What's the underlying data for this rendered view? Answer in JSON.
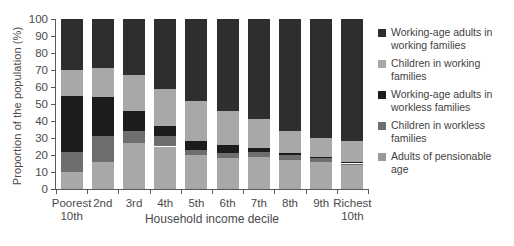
{
  "chart_data": {
    "type": "bar",
    "stacked": true,
    "title": "",
    "xlabel": "Household income decile",
    "ylabel": "Proportion of the population (%)",
    "ylim": [
      0,
      100
    ],
    "ytick_labels": [
      "0",
      "10",
      "20",
      "30",
      "40",
      "50",
      "60",
      "70",
      "80",
      "90",
      "100"
    ],
    "yticks": [
      0,
      10,
      20,
      30,
      40,
      50,
      60,
      70,
      80,
      90,
      100
    ],
    "grid": false,
    "legend_position": "right",
    "categories": [
      "Poorest\n10th",
      "2nd",
      "3rd",
      "4th",
      "5th",
      "6th",
      "7th",
      "8th",
      "9th",
      "Richest\n10th"
    ],
    "category_labels": [
      [
        "Poorest",
        "10th"
      ],
      [
        "2nd",
        ""
      ],
      [
        "3rd",
        ""
      ],
      [
        "4th",
        ""
      ],
      [
        "5th",
        ""
      ],
      [
        "6th",
        ""
      ],
      [
        "7th",
        ""
      ],
      [
        "8th",
        ""
      ],
      [
        "9th",
        ""
      ],
      [
        "Richest",
        "10th"
      ]
    ],
    "series": [
      {
        "name": "Adults of pensionable age",
        "color": "#a8a8a8",
        "values": [
          10,
          16,
          27,
          25,
          20,
          18,
          19,
          17,
          16,
          14
        ]
      },
      {
        "name": "Children in workless families",
        "color": "#6e6e6e",
        "values": [
          12,
          15,
          7,
          6,
          3,
          3,
          3,
          3,
          2,
          1
        ]
      },
      {
        "name": "Working-age adults in workless families",
        "color": "#1c1c1c",
        "values": [
          33,
          23,
          12,
          6,
          5,
          5,
          2,
          1,
          1,
          1
        ]
      },
      {
        "name": "Children in working families",
        "color": "#a8a8a8",
        "values": [
          15,
          17,
          21,
          22,
          24,
          20,
          17,
          13,
          11,
          12
        ]
      },
      {
        "name": "Working-age adults in working families",
        "color": "#2e2e2e",
        "values": [
          30,
          29,
          33,
          41,
          48,
          54,
          59,
          66,
          70,
          72
        ]
      }
    ],
    "legend_entries": [
      {
        "label": [
          "Working-age adults in",
          "working families"
        ],
        "color": "#2e2e2e"
      },
      {
        "label": [
          "Children in working",
          "families"
        ],
        "color": "#a8a8a8"
      },
      {
        "label": [
          "Working-age adults in",
          "workless families"
        ],
        "color": "#1c1c1c"
      },
      {
        "label": [
          "Children in workless",
          "families"
        ],
        "color": "#6e6e6e"
      },
      {
        "label": [
          "Adults of pensionable",
          "age"
        ],
        "color": "#9a9a9a"
      }
    ]
  }
}
